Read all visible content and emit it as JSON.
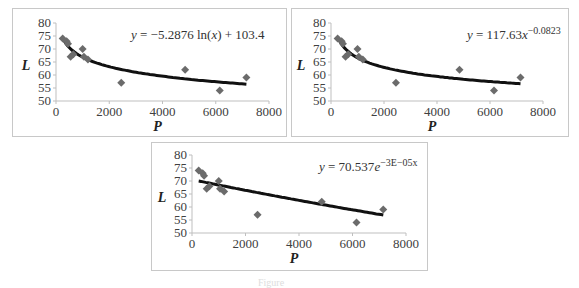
{
  "caption": "Figure",
  "chart_data": [
    {
      "type": "scatter",
      "title": "",
      "xlabel": "P",
      "ylabel": "L",
      "xlim": [
        0,
        8000
      ],
      "ylim": [
        50,
        80
      ],
      "xticks": [
        0,
        2000,
        4000,
        6000,
        8000
      ],
      "yticks": [
        50,
        55,
        60,
        65,
        70,
        75,
        80
      ],
      "grid": false,
      "series": [
        {
          "name": "data",
          "x": [
            250,
            400,
            450,
            550,
            650,
            1000,
            1050,
            1200,
            2450,
            4850,
            6150,
            7150
          ],
          "y": [
            74,
            73,
            72,
            67,
            68,
            70,
            67,
            66,
            57,
            62,
            54,
            59
          ]
        }
      ],
      "trendline": {
        "kind": "log",
        "a": -5.2876,
        "b": 103.4,
        "x_range": [
          250,
          7150
        ]
      },
      "annotation": "y = −5.2876 ln(x) + 103.4"
    },
    {
      "type": "scatter",
      "title": "",
      "xlabel": "P",
      "ylabel": "L",
      "xlim": [
        0,
        8000
      ],
      "ylim": [
        50,
        80
      ],
      "xticks": [
        0,
        2000,
        4000,
        6000,
        8000
      ],
      "yticks": [
        50,
        55,
        60,
        65,
        70,
        75,
        80
      ],
      "grid": false,
      "series": [
        {
          "name": "data",
          "x": [
            250,
            400,
            450,
            550,
            650,
            1000,
            1050,
            1200,
            2450,
            4850,
            6150,
            7150
          ],
          "y": [
            74,
            73,
            72,
            67,
            68,
            70,
            67,
            66,
            57,
            62,
            54,
            59
          ]
        }
      ],
      "trendline": {
        "kind": "power",
        "a": 117.63,
        "b": -0.0823,
        "x_range": [
          250,
          7150
        ]
      },
      "annotation": "y = 117.63x^−0.0823"
    },
    {
      "type": "scatter",
      "title": "",
      "xlabel": "P",
      "ylabel": "L",
      "xlim": [
        0,
        8000
      ],
      "ylim": [
        50,
        80
      ],
      "xticks": [
        0,
        2000,
        4000,
        6000,
        8000
      ],
      "yticks": [
        50,
        55,
        60,
        65,
        70,
        75,
        80
      ],
      "grid": false,
      "series": [
        {
          "name": "data",
          "x": [
            250,
            400,
            450,
            550,
            650,
            1000,
            1050,
            1200,
            2450,
            4850,
            6150,
            7150
          ],
          "y": [
            74,
            73,
            72,
            67,
            68,
            70,
            67,
            66,
            57,
            62,
            54,
            59
          ]
        }
      ],
      "trendline": {
        "kind": "exp",
        "a": 70.537,
        "b": -3e-05,
        "x_range": [
          250,
          7150
        ]
      },
      "annotation": "y = 70.537e^−3E−05x"
    }
  ],
  "charts": [
    {
      "eq_pre": "y",
      "eq_main": " = −5.2876 ln(",
      "eq_x": "x",
      "eq_post": ") + 103.4",
      "eq_sup": ""
    },
    {
      "eq_pre": "y",
      "eq_main": " = 117.63",
      "eq_x": "x",
      "eq_post": "",
      "eq_sup": "−0.0823"
    },
    {
      "eq_pre": "y",
      "eq_main": " = 70.537",
      "eq_x": "e",
      "eq_post": "",
      "eq_sup": "−3E−05x"
    }
  ],
  "style": {
    "marker_color": "#6b6b6b",
    "line_color": "#111111",
    "axis_color": "#bfbfbf",
    "text_color": "#404040"
  }
}
